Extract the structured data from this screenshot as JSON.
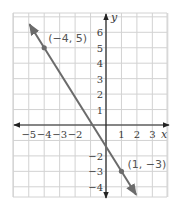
{
  "chart_data": {
    "type": "line",
    "title": "",
    "xlabel": "x",
    "ylabel": "y",
    "xlim": [
      -6,
      4
    ],
    "ylim": [
      -4.7,
      7.2
    ],
    "grid": true,
    "x_ticks": [
      -5,
      -4,
      -3,
      -2,
      1,
      2,
      3
    ],
    "y_ticks": [
      6,
      5,
      4,
      3,
      2,
      1,
      -2,
      -3,
      -4
    ],
    "x_tick_labels": [
      "−5",
      "−4",
      "−3",
      "−2",
      "1",
      "2",
      "3"
    ],
    "y_tick_labels": [
      "6",
      "5",
      "4",
      "3",
      "2",
      "1",
      "−2",
      "−3",
      "−4"
    ],
    "series": [
      {
        "name": "line through (−4, 5) and (1, −3)",
        "slope": -1.6,
        "intercept": -1.4,
        "color": "#6b6b6b",
        "points": [
          {
            "x": -4,
            "y": 5,
            "label": "(−4, 5)"
          },
          {
            "x": 1,
            "y": -3,
            "label": "(1, −3)"
          }
        ]
      }
    ]
  },
  "colors": {
    "grid": "#d2d2d2",
    "axes": "#222222",
    "line": "#6b6b6b",
    "background": "#ffffff"
  }
}
